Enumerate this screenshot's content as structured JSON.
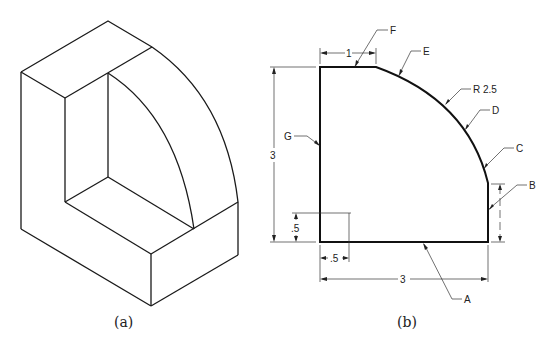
{
  "figure": {
    "panel_a": {
      "caption": "(a)",
      "description": "isometric view of quarter-round bracket with L-shaped cutout"
    },
    "panel_b": {
      "caption": "(b)",
      "description": "orthographic profile view with dimensions and labeled edges",
      "dimensions": {
        "height": "3",
        "width": "3",
        "top_flat": "1",
        "radius": "R 2.5",
        "inner_height": ".5",
        "inner_width": ".5"
      },
      "labels": {
        "A": "A",
        "B": "B",
        "C": "C",
        "D": "D",
        "E": "E",
        "F": "F",
        "G": "G"
      }
    }
  },
  "colors": {
    "line": "#1a1a1a",
    "background": "#ffffff"
  }
}
